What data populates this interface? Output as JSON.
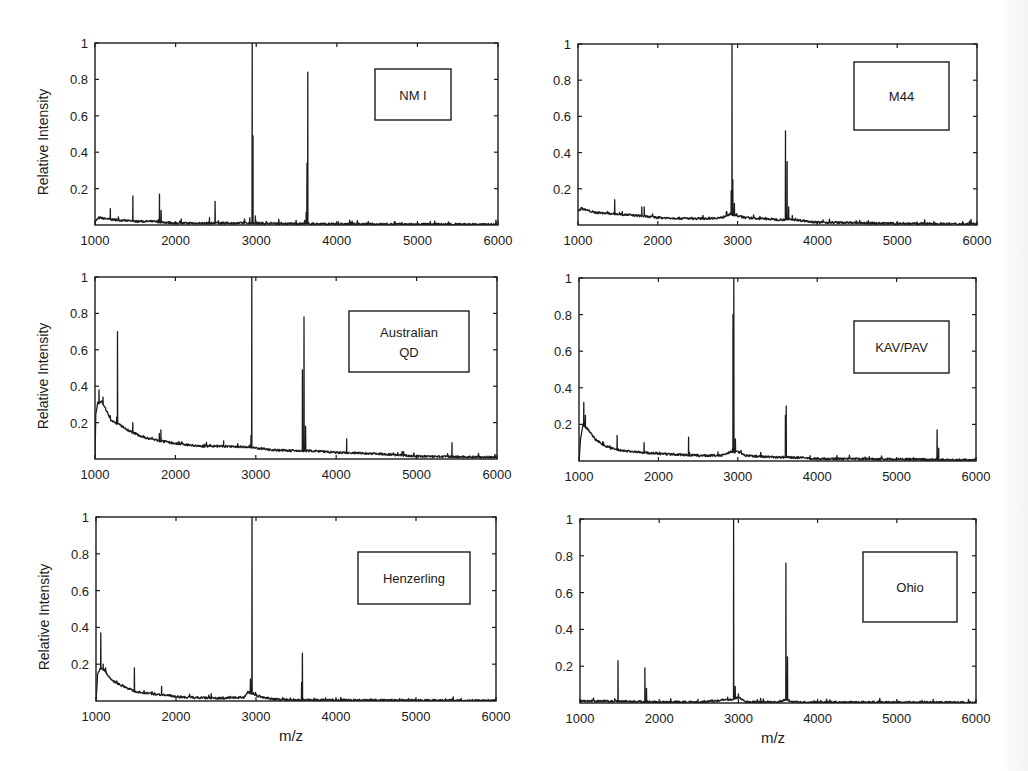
{
  "figure": {
    "shared_ylabel": "Relative Intensity",
    "shared_xlabel": "m/z"
  },
  "chart_data": [
    {
      "type": "line",
      "panel": "top-left",
      "legend": [
        "NM I"
      ],
      "xlabel": "",
      "ylabel": "Relative Intensity",
      "xlim": [
        1000,
        6000
      ],
      "ylim": [
        0,
        1
      ],
      "xticks": [
        1000,
        2000,
        3000,
        4000,
        5000,
        6000
      ],
      "yticks": [
        0.2,
        0.4,
        0.6,
        0.8,
        1
      ],
      "grid": false,
      "legend_position": "upper right",
      "box": {
        "x": 375,
        "y": 69,
        "w": 76,
        "h": 51
      },
      "baseline": [
        [
          1000,
          0.02
        ],
        [
          1050,
          0.04
        ],
        [
          1200,
          0.03
        ],
        [
          1500,
          0.02
        ],
        [
          1700,
          0.02
        ],
        [
          2000,
          0.01
        ],
        [
          2500,
          0.01
        ],
        [
          3000,
          0.01
        ],
        [
          4000,
          0.005
        ],
        [
          6000,
          0.003
        ]
      ],
      "peaks": [
        [
          1190,
          0.09
        ],
        [
          1470,
          0.16
        ],
        [
          1800,
          0.17
        ],
        [
          1820,
          0.08
        ],
        [
          2420,
          0.04
        ],
        [
          2490,
          0.13
        ],
        [
          2920,
          0.04
        ],
        [
          2950,
          1.0
        ],
        [
          2960,
          0.49
        ],
        [
          2990,
          0.05
        ],
        [
          3640,
          0.84
        ],
        [
          3630,
          0.34
        ],
        [
          3620,
          0.07
        ],
        [
          5470,
          0.01
        ]
      ]
    },
    {
      "type": "line",
      "panel": "top-right",
      "legend": [
        "M44"
      ],
      "xlabel": "",
      "ylabel": "",
      "xlim": [
        1000,
        6000
      ],
      "ylim": [
        0,
        1
      ],
      "xticks": [
        1000,
        2000,
        3000,
        4000,
        5000,
        6000
      ],
      "yticks": [
        0.2,
        0.4,
        0.6,
        0.8,
        1
      ],
      "grid": false,
      "legend_position": "upper right",
      "box": {
        "x": 854,
        "y": 62,
        "w": 95,
        "h": 68
      },
      "baseline": [
        [
          1000,
          0.08
        ],
        [
          1050,
          0.09
        ],
        [
          1200,
          0.07
        ],
        [
          1500,
          0.06
        ],
        [
          1800,
          0.05
        ],
        [
          2000,
          0.04
        ],
        [
          2500,
          0.035
        ],
        [
          2800,
          0.04
        ],
        [
          2900,
          0.06
        ],
        [
          3000,
          0.05
        ],
        [
          3100,
          0.04
        ],
        [
          3500,
          0.03
        ],
        [
          3700,
          0.03
        ],
        [
          4000,
          0.015
        ],
        [
          5000,
          0.008
        ],
        [
          6000,
          0.005
        ]
      ],
      "peaks": [
        [
          1460,
          0.14
        ],
        [
          1520,
          0.07
        ],
        [
          1800,
          0.1
        ],
        [
          1830,
          0.1
        ],
        [
          2920,
          0.19
        ],
        [
          2930,
          1.0
        ],
        [
          2940,
          0.25
        ],
        [
          2960,
          0.12
        ],
        [
          3600,
          0.52
        ],
        [
          3620,
          0.35
        ],
        [
          3640,
          0.1
        ],
        [
          5460,
          0.02
        ]
      ]
    },
    {
      "type": "line",
      "panel": "middle-left",
      "legend": [
        "Australian",
        "QD"
      ],
      "xlabel": "",
      "ylabel": "Relative Intensity",
      "xlim": [
        1000,
        6000
      ],
      "ylim": [
        0,
        1
      ],
      "xticks": [
        1000,
        2000,
        3000,
        4000,
        5000,
        6000
      ],
      "yticks": [
        0.2,
        0.4,
        0.6,
        0.8,
        1
      ],
      "grid": false,
      "legend_position": "upper right",
      "box": {
        "x": 349,
        "y": 311,
        "w": 120,
        "h": 61
      },
      "baseline": [
        [
          1000,
          0.0
        ],
        [
          1010,
          0.25
        ],
        [
          1030,
          0.3
        ],
        [
          1080,
          0.32
        ],
        [
          1150,
          0.26
        ],
        [
          1200,
          0.21
        ],
        [
          1300,
          0.19
        ],
        [
          1400,
          0.16
        ],
        [
          1500,
          0.14
        ],
        [
          1600,
          0.12
        ],
        [
          1700,
          0.11
        ],
        [
          1800,
          0.1
        ],
        [
          2000,
          0.085
        ],
        [
          2300,
          0.07
        ],
        [
          2600,
          0.07
        ],
        [
          2900,
          0.065
        ],
        [
          3000,
          0.06
        ],
        [
          3200,
          0.05
        ],
        [
          3500,
          0.045
        ],
        [
          3700,
          0.045
        ],
        [
          4000,
          0.035
        ],
        [
          4500,
          0.03
        ],
        [
          5000,
          0.015
        ],
        [
          5500,
          0.012
        ],
        [
          6000,
          0.01
        ]
      ],
      "peaks": [
        [
          1050,
          0.38
        ],
        [
          1100,
          0.34
        ],
        [
          1280,
          0.7
        ],
        [
          1270,
          0.23
        ],
        [
          1470,
          0.2
        ],
        [
          1710,
          0.12
        ],
        [
          1820,
          0.16
        ],
        [
          1800,
          0.14
        ],
        [
          2600,
          0.1
        ],
        [
          2940,
          0.13
        ],
        [
          2950,
          1.0
        ],
        [
          3580,
          0.49
        ],
        [
          3600,
          0.78
        ],
        [
          3620,
          0.18
        ],
        [
          4130,
          0.11
        ],
        [
          4840,
          0.04
        ],
        [
          5440,
          0.09
        ]
      ]
    },
    {
      "type": "line",
      "panel": "middle-right",
      "legend": [
        "KAV/PAV"
      ],
      "xlabel": "",
      "ylabel": "",
      "xlim": [
        1000,
        6000
      ],
      "ylim": [
        0,
        1
      ],
      "xticks": [
        1000,
        2000,
        3000,
        4000,
        5000,
        6000
      ],
      "yticks": [
        0.2,
        0.4,
        0.6,
        0.8,
        1
      ],
      "grid": false,
      "legend_position": "upper right",
      "box": {
        "x": 854,
        "y": 321,
        "w": 95,
        "h": 52
      },
      "baseline": [
        [
          1000,
          0.0
        ],
        [
          1020,
          0.12
        ],
        [
          1050,
          0.2
        ],
        [
          1100,
          0.18
        ],
        [
          1200,
          0.12
        ],
        [
          1300,
          0.09
        ],
        [
          1400,
          0.07
        ],
        [
          1500,
          0.06
        ],
        [
          1700,
          0.05
        ],
        [
          2000,
          0.04
        ],
        [
          2500,
          0.03
        ],
        [
          2800,
          0.03
        ],
        [
          2900,
          0.05
        ],
        [
          3000,
          0.05
        ],
        [
          3100,
          0.03
        ],
        [
          3500,
          0.02
        ],
        [
          3700,
          0.02
        ],
        [
          4000,
          0.012
        ],
        [
          5000,
          0.01
        ],
        [
          5400,
          0.008
        ],
        [
          6000,
          0.005
        ]
      ],
      "peaks": [
        [
          1060,
          0.32
        ],
        [
          1080,
          0.25
        ],
        [
          1310,
          0.1
        ],
        [
          1480,
          0.14
        ],
        [
          1820,
          0.1
        ],
        [
          1970,
          0.05
        ],
        [
          2380,
          0.13
        ],
        [
          2750,
          0.05
        ],
        [
          2940,
          0.8
        ],
        [
          2950,
          1.0
        ],
        [
          2970,
          0.12
        ],
        [
          3600,
          0.25
        ],
        [
          3610,
          0.3
        ],
        [
          5510,
          0.17
        ],
        [
          5530,
          0.07
        ]
      ]
    },
    {
      "type": "line",
      "panel": "bottom-left",
      "legend": [
        "Henzerling"
      ],
      "xlabel": "m/z",
      "ylabel": "Relative Intensity",
      "xlim": [
        1000,
        6000
      ],
      "ylim": [
        0,
        1
      ],
      "xticks": [
        1000,
        2000,
        3000,
        4000,
        5000,
        6000
      ],
      "yticks": [
        0.2,
        0.4,
        0.6,
        0.8,
        1
      ],
      "grid": false,
      "legend_position": "upper right",
      "box": {
        "x": 358,
        "y": 552,
        "w": 112,
        "h": 52
      },
      "baseline": [
        [
          1000,
          0.0
        ],
        [
          1020,
          0.14
        ],
        [
          1050,
          0.18
        ],
        [
          1100,
          0.17
        ],
        [
          1200,
          0.11
        ],
        [
          1300,
          0.09
        ],
        [
          1400,
          0.07
        ],
        [
          1500,
          0.05
        ],
        [
          1700,
          0.04
        ],
        [
          1900,
          0.03
        ],
        [
          2100,
          0.02
        ],
        [
          2500,
          0.015
        ],
        [
          2850,
          0.02
        ],
        [
          2900,
          0.05
        ],
        [
          3000,
          0.03
        ],
        [
          3200,
          0.01
        ],
        [
          3500,
          0.005
        ],
        [
          4000,
          0.005
        ],
        [
          6000,
          0.002
        ]
      ],
      "peaks": [
        [
          1060,
          0.37
        ],
        [
          1090,
          0.2
        ],
        [
          1260,
          0.11
        ],
        [
          1480,
          0.18
        ],
        [
          1820,
          0.08
        ],
        [
          2440,
          0.04
        ],
        [
          2930,
          0.12
        ],
        [
          2950,
          1.0
        ],
        [
          3580,
          0.26
        ],
        [
          3570,
          0.1
        ],
        [
          5450,
          0.01
        ]
      ]
    },
    {
      "type": "line",
      "panel": "bottom-right",
      "legend": [
        "Ohio"
      ],
      "xlabel": "m/z",
      "ylabel": "",
      "xlim": [
        1000,
        6000
      ],
      "ylim": [
        0,
        1
      ],
      "xticks": [
        1000,
        2000,
        3000,
        4000,
        5000,
        6000
      ],
      "yticks": [
        0.2,
        0.4,
        0.6,
        0.8,
        1
      ],
      "grid": false,
      "legend_position": "upper right",
      "box": {
        "x": 863,
        "y": 552,
        "w": 94,
        "h": 70
      },
      "baseline": [
        [
          1000,
          0.01
        ],
        [
          1500,
          0.01
        ],
        [
          2000,
          0.005
        ],
        [
          2500,
          0.005
        ],
        [
          2900,
          0.02
        ],
        [
          3000,
          0.03
        ],
        [
          3100,
          0.005
        ],
        [
          3500,
          0.005
        ],
        [
          3600,
          0.02
        ],
        [
          3700,
          0.005
        ],
        [
          4000,
          0.004
        ],
        [
          6000,
          0.003
        ]
      ],
      "peaks": [
        [
          1480,
          0.23
        ],
        [
          1820,
          0.19
        ],
        [
          1840,
          0.08
        ],
        [
          2490,
          0.02
        ],
        [
          2940,
          1.0
        ],
        [
          2960,
          0.09
        ],
        [
          3000,
          0.05
        ],
        [
          3600,
          0.76
        ],
        [
          3620,
          0.25
        ],
        [
          5460,
          0.02
        ]
      ]
    }
  ],
  "layout": {
    "panels": [
      {
        "x0": 95,
        "y0": 43,
        "x1": 498,
        "y1": 225
      },
      {
        "x0": 578,
        "y0": 44,
        "x1": 977,
        "y1": 225
      },
      {
        "x0": 95,
        "y0": 277,
        "x1": 497,
        "y1": 459
      },
      {
        "x0": 579,
        "y0": 278,
        "x1": 976,
        "y1": 461
      },
      {
        "x0": 96,
        "y0": 517,
        "x1": 496,
        "y1": 701
      },
      {
        "x0": 580,
        "y0": 519,
        "x1": 976,
        "y1": 703
      }
    ]
  }
}
